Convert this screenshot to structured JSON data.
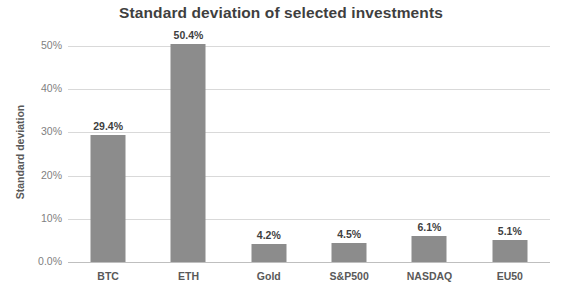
{
  "chart_data": {
    "type": "bar",
    "title": "Standard deviation of selected investments",
    "xlabel": "",
    "ylabel": "Standard deviation",
    "categories": [
      "BTC",
      "ETH",
      "Gold",
      "S&P500",
      "NASDAQ",
      "EU50"
    ],
    "values": [
      29.4,
      50.4,
      4.2,
      4.5,
      6.1,
      5.1
    ],
    "data_labels": [
      "29.4%",
      "50.4%",
      "4.2%",
      "4.5%",
      "6.1%",
      "5.1%"
    ],
    "ylim": [
      0,
      50
    ],
    "y_ticks": [
      0,
      10,
      20,
      30,
      40,
      50
    ],
    "y_tick_labels": [
      "0.0%",
      "10%",
      "20%",
      "30%",
      "40%",
      "50%"
    ],
    "grid": true,
    "legend": "none",
    "series_color": "#8c8c8c",
    "gridline_color": "#d9d9d9",
    "title_color": "#3f3f3f",
    "label_color": "#595959",
    "tick_color": "#7f7f7f"
  }
}
